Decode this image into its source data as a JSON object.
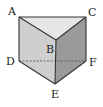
{
  "diagram": {
    "type": "triangular-prism",
    "colors": {
      "top_face": "#e6e6e6",
      "left_face": "#cfcfcf",
      "right_face": "#9a9a9a",
      "edge": "#333333",
      "hidden_edge": "#555555",
      "label": "#222222"
    },
    "vertices": {
      "A": {
        "label": "A",
        "x": 19,
        "y": 17
      },
      "B": {
        "label": "B",
        "x": 56,
        "y": 40
      },
      "C": {
        "label": "C",
        "x": 86,
        "y": 17
      },
      "D": {
        "label": "D",
        "x": 19,
        "y": 61
      },
      "E": {
        "label": "E",
        "x": 55,
        "y": 84
      },
      "F": {
        "label": "F",
        "x": 86,
        "y": 61
      }
    },
    "labels": {
      "A": "A",
      "B": "B",
      "C": "C",
      "D": "D",
      "E": "E",
      "F": "F"
    },
    "hidden_edges": [
      "DF"
    ]
  }
}
